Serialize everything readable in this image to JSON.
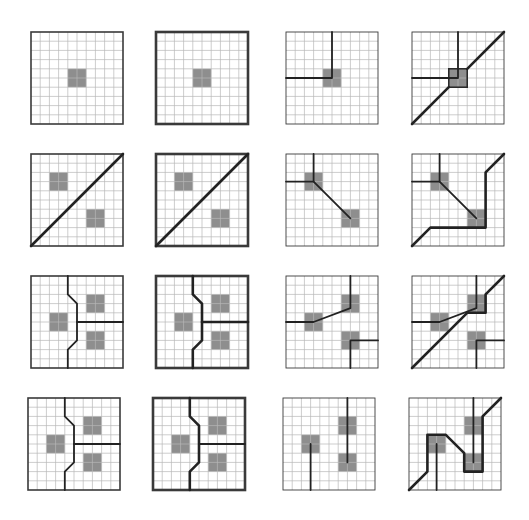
{
  "figure": {
    "title": "Grid segmentation panels",
    "grid_size": 10,
    "colors": {
      "fill": "#8e8e8e",
      "grid": "#b8b8b8",
      "line": "#222222",
      "border": "#3a3a3a"
    },
    "panels": [
      {
        "id": "p1",
        "row": 1,
        "col": 1,
        "border": "thin",
        "cells": [
          [
            4,
            4,
            6,
            6
          ]
        ],
        "outlined_cells": [],
        "paths": []
      },
      {
        "id": "p2",
        "row": 1,
        "col": 2,
        "border": "thick",
        "cells": [
          [
            4,
            4,
            6,
            6
          ]
        ],
        "outlined_cells": [],
        "paths": []
      },
      {
        "id": "p3",
        "row": 1,
        "col": 3,
        "border": "none",
        "cells": [
          [
            4,
            4,
            6,
            6
          ]
        ],
        "outlined_cells": [],
        "paths": [
          {
            "weight": "medium",
            "points": [
              [
                5,
                0
              ],
              [
                5,
                5
              ],
              [
                0,
                5
              ]
            ]
          }
        ]
      },
      {
        "id": "p4",
        "row": 1,
        "col": 4,
        "border": "none",
        "cells": [
          [
            4,
            4,
            6,
            6
          ]
        ],
        "outlined_cells": [
          [
            4,
            4,
            6,
            6
          ]
        ],
        "paths": [
          {
            "weight": "medium",
            "points": [
              [
                5,
                0
              ],
              [
                5,
                5
              ],
              [
                0,
                5
              ]
            ]
          },
          {
            "weight": "heavy",
            "points": [
              [
                0,
                10
              ],
              [
                4,
                6
              ]
            ]
          },
          {
            "weight": "heavy",
            "points": [
              [
                6,
                4
              ],
              [
                10,
                0
              ]
            ]
          }
        ]
      },
      {
        "id": "p5",
        "row": 2,
        "col": 1,
        "border": "thin",
        "cells": [
          [
            2,
            2,
            4,
            4
          ],
          [
            6,
            6,
            8,
            8
          ]
        ],
        "outlined_cells": [],
        "paths": [
          {
            "weight": "heavy",
            "points": [
              [
                0,
                10
              ],
              [
                10,
                0
              ]
            ]
          }
        ]
      },
      {
        "id": "p6",
        "row": 2,
        "col": 2,
        "border": "thick",
        "cells": [
          [
            2,
            2,
            4,
            4
          ],
          [
            6,
            6,
            8,
            8
          ]
        ],
        "outlined_cells": [],
        "paths": [
          {
            "weight": "heavy",
            "points": [
              [
                0,
                10
              ],
              [
                10,
                0
              ]
            ]
          }
        ]
      },
      {
        "id": "p7",
        "row": 2,
        "col": 3,
        "border": "none",
        "cells": [
          [
            2,
            2,
            4,
            4
          ],
          [
            6,
            6,
            8,
            8
          ]
        ],
        "outlined_cells": [],
        "paths": [
          {
            "weight": "medium",
            "points": [
              [
                3,
                0
              ],
              [
                3,
                3
              ],
              [
                0,
                3
              ]
            ]
          },
          {
            "weight": "medium",
            "points": [
              [
                3,
                3
              ],
              [
                7,
                7
              ]
            ]
          }
        ]
      },
      {
        "id": "p8",
        "row": 2,
        "col": 4,
        "border": "none",
        "cells": [
          [
            2,
            2,
            4,
            4
          ],
          [
            6,
            6,
            8,
            8
          ]
        ],
        "outlined_cells": [],
        "paths": [
          {
            "weight": "medium",
            "points": [
              [
                3,
                0
              ],
              [
                3,
                3
              ],
              [
                0,
                3
              ]
            ]
          },
          {
            "weight": "medium",
            "points": [
              [
                3,
                3
              ],
              [
                7,
                7
              ]
            ]
          },
          {
            "weight": "heavy",
            "points": [
              [
                0,
                10
              ],
              [
                2,
                8
              ],
              [
                8,
                8
              ],
              [
                8,
                2
              ],
              [
                10,
                0
              ]
            ]
          }
        ]
      },
      {
        "id": "p9",
        "row": 3,
        "col": 1,
        "border": "thin",
        "cells": [
          [
            2,
            4,
            4,
            6
          ],
          [
            6,
            2,
            8,
            4
          ],
          [
            6,
            6,
            8,
            8
          ]
        ],
        "outlined_cells": [],
        "paths": [
          {
            "weight": "medium",
            "points": [
              [
                4,
                0
              ],
              [
                4,
                2
              ],
              [
                5,
                3
              ],
              [
                5,
                7
              ],
              [
                4,
                8
              ],
              [
                4,
                10
              ]
            ]
          },
          {
            "weight": "medium",
            "points": [
              [
                5,
                5
              ],
              [
                10,
                5
              ]
            ]
          }
        ]
      },
      {
        "id": "p10",
        "row": 3,
        "col": 2,
        "border": "thick",
        "cells": [
          [
            2,
            4,
            4,
            6
          ],
          [
            6,
            2,
            8,
            4
          ],
          [
            6,
            6,
            8,
            8
          ]
        ],
        "outlined_cells": [],
        "paths": [
          {
            "weight": "heavy",
            "points": [
              [
                4,
                0
              ],
              [
                4,
                2
              ],
              [
                5,
                3
              ],
              [
                5,
                7
              ],
              [
                4,
                8
              ],
              [
                4,
                10
              ]
            ]
          },
          {
            "weight": "heavy",
            "points": [
              [
                5,
                5
              ],
              [
                10,
                5
              ]
            ]
          }
        ]
      },
      {
        "id": "p11",
        "row": 3,
        "col": 3,
        "border": "none",
        "cells": [
          [
            2,
            4,
            4,
            6
          ],
          [
            6,
            2,
            8,
            4
          ],
          [
            6,
            6,
            8,
            8
          ]
        ],
        "outlined_cells": [],
        "paths": [
          {
            "weight": "medium",
            "points": [
              [
                0,
                5
              ],
              [
                3,
                5
              ],
              [
                7,
                3.5
              ],
              [
                7,
                0
              ]
            ]
          },
          {
            "weight": "medium",
            "points": [
              [
                10,
                7
              ],
              [
                7,
                7
              ],
              [
                7,
                10
              ]
            ]
          }
        ]
      },
      {
        "id": "p12",
        "row": 3,
        "col": 4,
        "border": "none",
        "cells": [
          [
            2,
            4,
            4,
            6
          ],
          [
            6,
            2,
            8,
            4
          ],
          [
            6,
            6,
            8,
            8
          ]
        ],
        "outlined_cells": [],
        "paths": [
          {
            "weight": "medium",
            "points": [
              [
                0,
                5
              ],
              [
                3,
                5
              ],
              [
                7,
                3.5
              ],
              [
                7,
                0
              ]
            ]
          },
          {
            "weight": "medium",
            "points": [
              [
                10,
                7
              ],
              [
                7,
                7
              ],
              [
                7,
                10
              ]
            ]
          },
          {
            "weight": "heavy",
            "points": [
              [
                0,
                10
              ],
              [
                6,
                4
              ],
              [
                8,
                4
              ],
              [
                8,
                2
              ],
              [
                10,
                0
              ]
            ]
          }
        ]
      },
      {
        "id": "p13",
        "row": 4,
        "col": 1,
        "border": "thin",
        "cells": [
          [
            2,
            4,
            4,
            6
          ],
          [
            6,
            2,
            8,
            4
          ],
          [
            6,
            6,
            8,
            8
          ]
        ],
        "outlined_cells": [],
        "paths": [
          {
            "weight": "medium",
            "points": [
              [
                4,
                0
              ],
              [
                4,
                2
              ],
              [
                5,
                3
              ],
              [
                5,
                7
              ],
              [
                4,
                8
              ],
              [
                4,
                10
              ]
            ]
          },
          {
            "weight": "medium",
            "points": [
              [
                5,
                5
              ],
              [
                10,
                5
              ]
            ]
          }
        ]
      },
      {
        "id": "p14",
        "row": 4,
        "col": 2,
        "border": "thick",
        "cells": [
          [
            2,
            4,
            4,
            6
          ],
          [
            6,
            2,
            8,
            4
          ],
          [
            6,
            6,
            8,
            8
          ]
        ],
        "outlined_cells": [],
        "paths": [
          {
            "weight": "heavy",
            "points": [
              [
                4,
                0
              ],
              [
                4,
                2
              ],
              [
                5,
                3
              ],
              [
                5,
                7
              ],
              [
                4,
                8
              ],
              [
                4,
                10
              ]
            ]
          },
          {
            "weight": "medium",
            "points": [
              [
                5,
                5
              ],
              [
                10,
                5
              ]
            ]
          }
        ]
      },
      {
        "id": "p15",
        "row": 4,
        "col": 3,
        "border": "none",
        "cells": [
          [
            2,
            4,
            4,
            6
          ],
          [
            6,
            2,
            8,
            4
          ],
          [
            6,
            6,
            8,
            8
          ]
        ],
        "outlined_cells": [],
        "paths": [
          {
            "weight": "medium",
            "points": [
              [
                3,
                5
              ],
              [
                3,
                10
              ]
            ]
          },
          {
            "weight": "medium",
            "points": [
              [
                7,
                0
              ],
              [
                7,
                7
              ]
            ]
          }
        ]
      },
      {
        "id": "p16",
        "row": 4,
        "col": 4,
        "border": "none",
        "cells": [
          [
            2,
            4,
            4,
            6
          ],
          [
            6,
            2,
            8,
            4
          ],
          [
            6,
            6,
            8,
            8
          ]
        ],
        "outlined_cells": [],
        "paths": [
          {
            "weight": "medium",
            "points": [
              [
                3,
                5
              ],
              [
                3,
                10
              ]
            ]
          },
          {
            "weight": "medium",
            "points": [
              [
                7,
                0
              ],
              [
                7,
                7
              ]
            ]
          },
          {
            "weight": "heavy",
            "points": [
              [
                0,
                10
              ],
              [
                2,
                8
              ],
              [
                2,
                4
              ],
              [
                4,
                4
              ],
              [
                6,
                6
              ],
              [
                6,
                8
              ],
              [
                8,
                8
              ],
              [
                8,
                2
              ],
              [
                10,
                0
              ]
            ]
          }
        ]
      }
    ]
  }
}
